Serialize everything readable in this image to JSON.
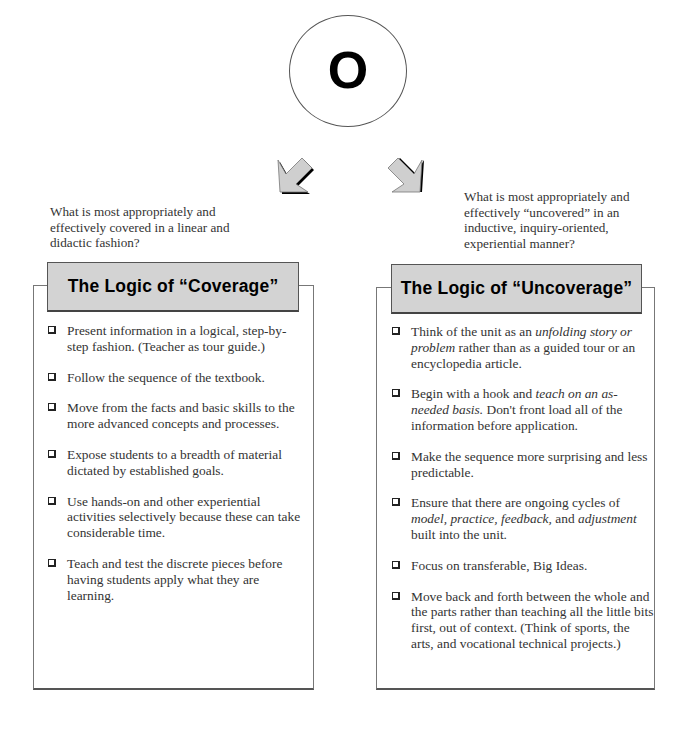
{
  "top": {
    "circle_letter": "O"
  },
  "left": {
    "caption": "What is most appropriately and effectively covered in a linear and didactic fashion?",
    "caption_lines": [
      "What is most appropriately and",
      "effectively covered in a linear and",
      "didactic fashion?"
    ],
    "title": "The Logic of “Coverage”",
    "items": [
      {
        "parts": [
          {
            "t": "Present information in a logical, step-by-step fashion. (Teacher as tour guide.)"
          }
        ]
      },
      {
        "parts": [
          {
            "t": "Follow the sequence of the textbook."
          }
        ]
      },
      {
        "parts": [
          {
            "t": "Move from the facts and basic skills to the more advanced concepts and processes."
          }
        ]
      },
      {
        "parts": [
          {
            "t": "Expose students to a breadth of material dictated by established goals."
          }
        ]
      },
      {
        "parts": [
          {
            "t": "Use hands-on and other experiential activities selectively because these can take considerable time."
          }
        ]
      },
      {
        "parts": [
          {
            "t": "Teach and test the discrete pieces before having students apply what they are learning."
          }
        ]
      }
    ]
  },
  "right": {
    "caption": "What is most appropriately and effectively “uncovered” in an inductive, inquiry-oriented, experiential manner?",
    "caption_lines": [
      "What is most appropriately and",
      "effectively “uncovered” in an",
      "inductive, inquiry-oriented,",
      "experiential manner?"
    ],
    "title": "The Logic of “Uncoverage”",
    "items": [
      {
        "parts": [
          {
            "t": "Think of the unit as an "
          },
          {
            "t": "unfolding story or problem",
            "i": true
          },
          {
            "t": " rather than as a guided tour or an encyclopedia article."
          }
        ]
      },
      {
        "parts": [
          {
            "t": "Begin with a hook and "
          },
          {
            "t": "teach on an as-needed basis.",
            "i": true
          },
          {
            "t": " Don't front load all of the information before application."
          }
        ]
      },
      {
        "parts": [
          {
            "t": "Make the sequence more surprising and less predictable."
          }
        ]
      },
      {
        "parts": [
          {
            "t": "Ensure that there are ongoing cycles of "
          },
          {
            "t": "model, practice, feedback,",
            "i": true
          },
          {
            "t": " and "
          },
          {
            "t": "adjustment",
            "i": true
          },
          {
            "t": " built into the unit."
          }
        ]
      },
      {
        "parts": [
          {
            "t": "Focus on transferable, Big Ideas."
          }
        ]
      },
      {
        "parts": [
          {
            "t": "Move back and forth between the whole and the parts rather than teaching all the little bits first, out of context. (Think of sports, the arts, and vocational technical projects.)"
          }
        ]
      }
    ]
  },
  "colors": {
    "title_fill": "#d3d3d3",
    "arrow_fill": "#cccccc",
    "border": "#555555"
  }
}
